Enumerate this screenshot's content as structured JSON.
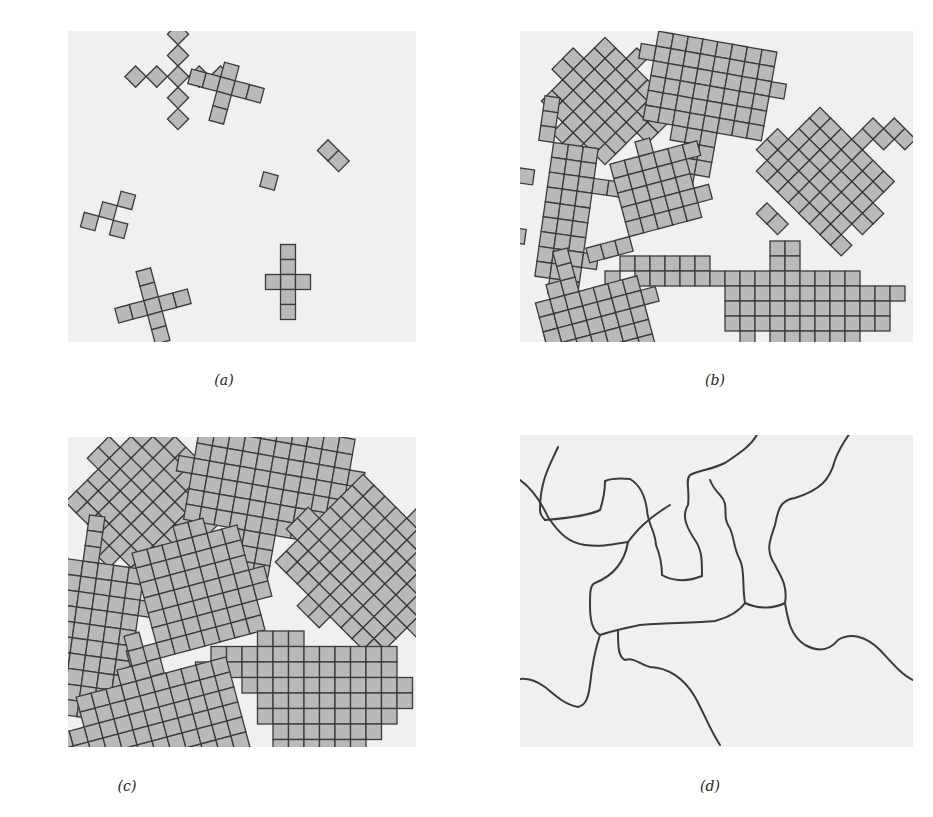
{
  "figure": {
    "panels": [
      {
        "id": "a",
        "caption": "(a)",
        "description": "Nucleation of small crystallites"
      },
      {
        "id": "b",
        "caption": "(b)",
        "description": "Growth of crystallites"
      },
      {
        "id": "c",
        "caption": "(c)",
        "description": "Crystallites impinge"
      },
      {
        "id": "d",
        "caption": "(d)",
        "description": "Grain boundaries"
      }
    ],
    "colors": {
      "panel_background": "#f0f0f0",
      "cell_fill": "#b9b9b9",
      "cell_stroke": "#3a3a3a",
      "boundary_line": "#3a3a3a"
    }
  }
}
